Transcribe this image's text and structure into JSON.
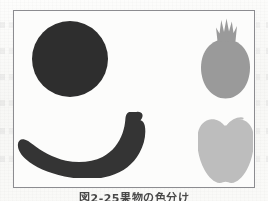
{
  "page": {
    "background_color": "#fbfbfa",
    "width": 268,
    "height": 201
  },
  "figure": {
    "frame_color": "#8c8c90",
    "frame_background": "#fcfcfb",
    "items": [
      {
        "id": "orange",
        "icon_name": "orange-silhouette-icon",
        "shape": "circle",
        "fill": "#2e2e2e",
        "tone": "dark"
      },
      {
        "id": "banana",
        "icon_name": "banana-silhouette-icon",
        "shape": "crescent",
        "fill": "#343434",
        "tone": "dark"
      },
      {
        "id": "pomegranate",
        "icon_name": "pomegranate-silhouette-icon",
        "shape": "round-with-crown",
        "fill": "#9a9a9a",
        "tone": "medium-gray"
      },
      {
        "id": "apple",
        "icon_name": "apple-silhouette-icon",
        "shape": "round-with-stem",
        "fill": "#bdbdbd",
        "tone": "light-gray"
      }
    ]
  },
  "caption": {
    "number": "図2-25",
    "text": "果物の色分け"
  }
}
